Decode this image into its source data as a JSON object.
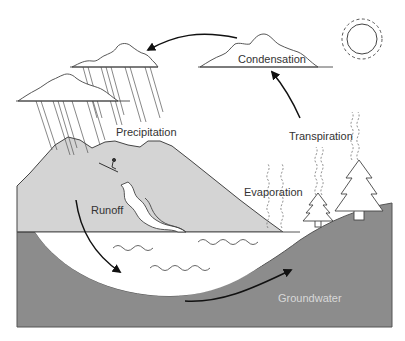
{
  "diagram": {
    "labels": {
      "condensation": "Condensation",
      "precipitation": "Precipitation",
      "transpiration": "Transpiration",
      "evaporation": "Evaporation",
      "runoff": "Runoff",
      "groundwater": "Groundwater"
    },
    "icons": {
      "sun": "sun-icon",
      "cloud_condensation": "cloud-icon",
      "cloud_rain_1": "rain-cloud-icon",
      "cloud_rain_2": "rain-cloud-icon",
      "mountain": "mountain-icon",
      "river": "river-icon",
      "skier": "skier-icon",
      "tree_small": "pine-tree-icon",
      "tree_large": "pine-tree-icon",
      "lake": "lake-icon"
    },
    "colors": {
      "background": "#ffffff",
      "ground": "#8c8c8c",
      "mountain": "#d4d4d4",
      "outline": "#333333",
      "arrow": "#111111",
      "label": "#333333",
      "groundwater_label": "#d8d8d8"
    }
  }
}
